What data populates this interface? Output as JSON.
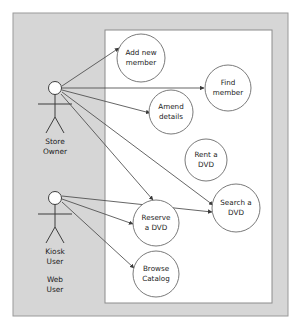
{
  "diagram": {
    "type": "uml-use-case-diagram",
    "canvas": {
      "width": 305,
      "height": 331,
      "background": "#ffffff"
    },
    "outer_frame": {
      "name": "diagram-frame",
      "x": 13,
      "y": 13,
      "width": 275,
      "height": 303,
      "fill": "#d6d6d6",
      "stroke": "#9a9a9a"
    },
    "system_boundary": {
      "name": "system-boundary",
      "label": "",
      "x": 105,
      "y": 30,
      "width": 167,
      "height": 273,
      "fill": "#ffffff",
      "stroke": "#8c8c8c"
    },
    "colors": {
      "line": "#4a4a4a",
      "ellipse_stroke": "#6b6b6b",
      "ellipse_fill": "#ffffff",
      "actor_stroke": "#3d3d3d",
      "actor_head_fill": "#ffffff",
      "text": "#1a1a1a",
      "frame_fill": "#d6d6d6",
      "page_background": "#ffffff"
    },
    "actors": [
      {
        "id": "store-owner",
        "label_lines": [
          "Store",
          "Owner"
        ],
        "head": {
          "cx": 55,
          "cy": 88,
          "r": 6.5
        },
        "body": {
          "x1": 55,
          "y1": 94.5,
          "x2": 55,
          "y2": 117
        },
        "arms": {
          "x1": 38,
          "y1": 104,
          "x2": 72,
          "y2": 104
        },
        "leg_left": {
          "x1": 55,
          "y1": 117,
          "x2": 46,
          "y2": 133
        },
        "leg_right": {
          "x1": 55,
          "y1": 117,
          "x2": 64,
          "y2": 133
        },
        "label_x": 55,
        "label_y": 142
      },
      {
        "id": "kiosk-web-user",
        "label_lines": [
          "Kiosk",
          "User"
        ],
        "secondary_label_lines": [
          "Web",
          "User"
        ],
        "head": {
          "cx": 55,
          "cy": 198,
          "r": 6.5
        },
        "body": {
          "x1": 55,
          "y1": 204.5,
          "x2": 55,
          "y2": 227
        },
        "arms": {
          "x1": 38,
          "y1": 214,
          "x2": 72,
          "y2": 214
        },
        "leg_left": {
          "x1": 55,
          "y1": 227,
          "x2": 46,
          "y2": 243
        },
        "leg_right": {
          "x1": 55,
          "y1": 227,
          "x2": 64,
          "y2": 243
        },
        "label_x": 55,
        "label_y": 252,
        "secondary_label_x": 55,
        "secondary_label_y": 280
      }
    ],
    "use_cases": [
      {
        "id": "add-new-member",
        "label_lines": [
          "Add new",
          "member"
        ],
        "cx": 141,
        "cy": 58,
        "rx": 24,
        "ry": 24
      },
      {
        "id": "find-member",
        "label_lines": [
          "Find",
          "member"
        ],
        "cx": 228,
        "cy": 88,
        "rx": 23,
        "ry": 23
      },
      {
        "id": "amend-details",
        "label_lines": [
          "Amend",
          "details"
        ],
        "cx": 171,
        "cy": 112,
        "rx": 22,
        "ry": 22
      },
      {
        "id": "rent-a-dvd",
        "label_lines": [
          "Rent a",
          "DVD"
        ],
        "cx": 206,
        "cy": 160,
        "rx": 21,
        "ry": 21
      },
      {
        "id": "search-a-dvd",
        "label_lines": [
          "Search a",
          "DVD"
        ],
        "cx": 236,
        "cy": 208,
        "rx": 24,
        "ry": 24
      },
      {
        "id": "reserve-a-dvd",
        "label_lines": [
          "Reserve",
          "a DVD"
        ],
        "cx": 156,
        "cy": 223,
        "rx": 23,
        "ry": 23
      },
      {
        "id": "browse-catalog",
        "label_lines": [
          "Browse",
          "Catalog"
        ],
        "cx": 156,
        "cy": 274,
        "rx": 23,
        "ry": 23
      }
    ],
    "associations": [
      {
        "id": "store-owner--add-new-member",
        "from": "store-owner",
        "to": "add-new-member",
        "x1": 62,
        "y1": 86,
        "x2": 119,
        "y2": 48
      },
      {
        "id": "store-owner--find-member",
        "from": "store-owner",
        "to": "find-member",
        "x1": 62,
        "y1": 88,
        "x2": 204,
        "y2": 88
      },
      {
        "id": "store-owner--amend-details",
        "from": "store-owner",
        "to": "amend-details",
        "x1": 62,
        "y1": 90,
        "x2": 150,
        "y2": 113
      },
      {
        "id": "store-owner--search-a-dvd",
        "from": "store-owner",
        "to": "search-a-dvd",
        "x1": 62,
        "y1": 92,
        "x2": 213,
        "y2": 205
      },
      {
        "id": "store-owner--reserve-a-dvd",
        "from": "store-owner",
        "to": "reserve-a-dvd",
        "x1": 61,
        "y1": 94,
        "x2": 153,
        "y2": 200
      },
      {
        "id": "kiosk-user--search-a-dvd",
        "from": "kiosk-web-user",
        "to": "search-a-dvd",
        "x1": 62,
        "y1": 196,
        "x2": 212,
        "y2": 212
      },
      {
        "id": "kiosk-user--reserve-a-dvd",
        "from": "kiosk-web-user",
        "to": "reserve-a-dvd",
        "x1": 62,
        "y1": 199,
        "x2": 133,
        "y2": 224
      },
      {
        "id": "kiosk-user--browse-catalog",
        "from": "kiosk-web-user",
        "to": "browse-catalog",
        "x1": 62,
        "y1": 202,
        "x2": 134,
        "y2": 268
      }
    ]
  }
}
